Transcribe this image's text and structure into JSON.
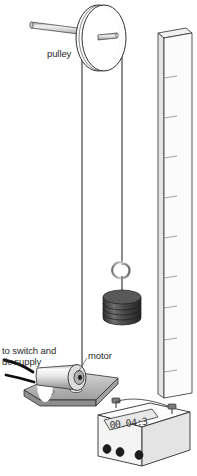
{
  "diagram": {
    "labels": {
      "pulley": "pulley",
      "motor": "motor",
      "supply_line1": "to switch and",
      "supply_line2": "dc supply"
    },
    "timer": {
      "display_value": "00.04:3",
      "button_count": 3
    },
    "ruler": {
      "tick_count": 9
    },
    "weights": {
      "disc_count": 4
    },
    "colors": {
      "outline": "#2f2f2f",
      "label_text": "#2b2b2b",
      "metal_light": "#f2f2f2",
      "metal_mid": "#c9c9c9",
      "metal_dark": "#8f8f8f",
      "weight_dark": "#3d3d3d",
      "weight_mid": "#595959",
      "wire": "#0d0d0d",
      "base_gray": "#b5b5b5",
      "lcd_bg": "#e8e8e8"
    }
  }
}
